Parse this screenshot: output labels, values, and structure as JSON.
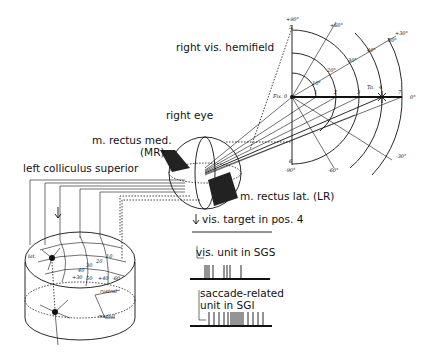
{
  "labels": {
    "hemifield": "right vis. hemifield",
    "eye": "right eye",
    "mr_line1": "m. rectus med.",
    "mr_line2": "(MR)",
    "colliculus": "left colliculus superior",
    "lr": "m. rectus lat. (LR)",
    "target": "vis. target in pos. 4",
    "vis_unit": "vis. unit in SGS",
    "sacc_line1": "saccade-related",
    "sacc_line2": "unit in SGI"
  },
  "field_map": {
    "angles": {
      "p90": "+90°",
      "p60": "+60°",
      "p30": "+30°",
      "zero": "0°",
      "m30": "-30°",
      "m60": "-60°",
      "m90": "-90°"
    },
    "eccentricities": {
      "e10": "10°",
      "e20": "20°",
      "e30": "30°",
      "e40": "40°",
      "e50": "50°"
    },
    "positions": {
      "origin": "0",
      "p1": "1",
      "p2": "2",
      "p3": "3",
      "p4": "4",
      "p5": "5",
      "p6": "6",
      "p7": "7"
    },
    "fix_label": "Fix.",
    "target_label": "Ta."
  },
  "colliculus_map": {
    "rostral": "rostral",
    "medial": "medial",
    "lateral": "lat.",
    "values": {
      "a": "+30",
      "b": "50",
      "c": "+40",
      "d": "-60",
      "e": "10",
      "f": "20",
      "g": "30",
      "h": "40"
    }
  }
}
